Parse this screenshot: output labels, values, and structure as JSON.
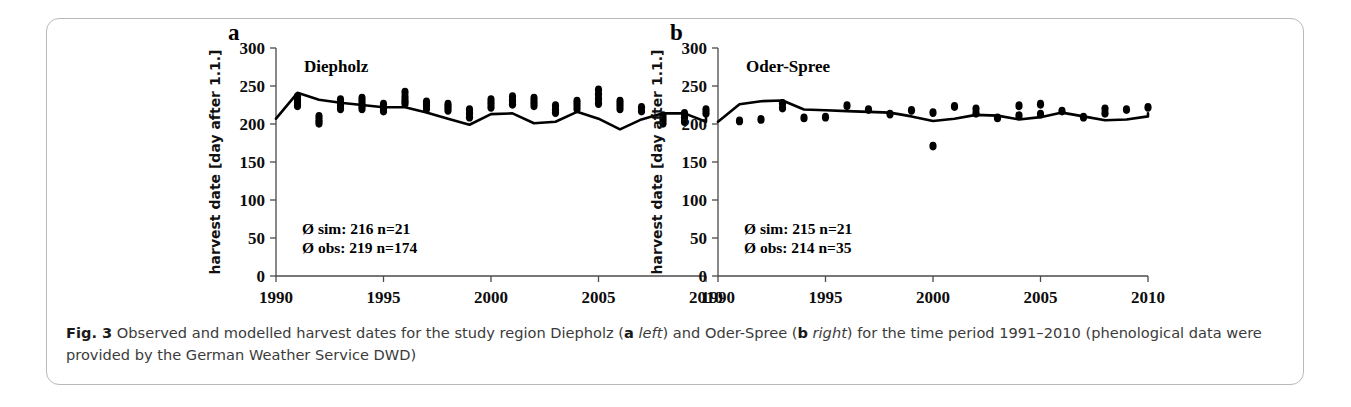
{
  "figure": {
    "id": "Fig. 3",
    "caption_text": "Observed and modelled harvest dates for the study region Diepholz (a left) and Oder-Spree (b right) for the time period 1991–2010 (phenological data were provided by the German Weather Service DWD)",
    "caption_part1": "Observed and modelled harvest dates for the study region Diepholz (",
    "caption_a": "a",
    "caption_a_ital": "left",
    "caption_part2": ") and Oder-Spree (",
    "caption_b": "b",
    "caption_b_ital": "right",
    "caption_part3": ") for the time period 1991–2010 (phenological data were provided by the German Weather Service DWD)",
    "border_color": "#b9b9b9",
    "line_color": "#000000",
    "point_color": "#000000"
  },
  "chart_data": [
    {
      "panel": "a",
      "type": "scatter",
      "title": "Diepholz",
      "xlabel": "",
      "ylabel": "harvest date [day after 1.1.]",
      "xlim": [
        1990,
        2010
      ],
      "ylim": [
        0,
        300
      ],
      "xticks": [
        1990,
        1995,
        2000,
        2005,
        2010
      ],
      "yticks": [
        0,
        50,
        100,
        150,
        200,
        250,
        300
      ],
      "grid": false,
      "legend": "none",
      "annotations": [
        "Ø sim: 216 n=21",
        "Ø obs: 219 n=174"
      ],
      "stats": {
        "sim_mean": 216,
        "sim_n": 21,
        "obs_mean": 219,
        "obs_n": 174
      },
      "series": [
        {
          "name": "simulated",
          "style": "line",
          "x": [
            1990,
            1991,
            1992,
            1993,
            1994,
            1995,
            1996,
            1997,
            1998,
            1999,
            2000,
            2001,
            2002,
            2003,
            2004,
            2005,
            2006,
            2007,
            2008,
            2009,
            2010
          ],
          "values": [
            207,
            241,
            232,
            228,
            225,
            222,
            222,
            215,
            207,
            199,
            213,
            214,
            201,
            203,
            216,
            207,
            193,
            206,
            214,
            214,
            203,
            217
          ]
        },
        {
          "name": "observed",
          "style": "points",
          "x": [
            1991,
            1991,
            1991,
            1991,
            1992,
            1992,
            1992,
            1993,
            1993,
            1993,
            1993,
            1994,
            1994,
            1994,
            1994,
            1995,
            1995,
            1995,
            1996,
            1996,
            1996,
            1996,
            1997,
            1997,
            1997,
            1998,
            1998,
            1998,
            1999,
            1999,
            1999,
            2000,
            2000,
            2000,
            2001,
            2001,
            2001,
            2002,
            2002,
            2002,
            2003,
            2003,
            2003,
            2004,
            2004,
            2004,
            2005,
            2005,
            2005,
            2005,
            2006,
            2006,
            2006,
            2007,
            2007,
            2008,
            2008,
            2008,
            2009,
            2009,
            2009,
            2010,
            2010
          ],
          "values": [
            236,
            232,
            228,
            224,
            210,
            205,
            201,
            232,
            228,
            224,
            220,
            234,
            229,
            224,
            220,
            226,
            221,
            217,
            242,
            236,
            231,
            227,
            229,
            225,
            220,
            226,
            222,
            218,
            219,
            214,
            209,
            232,
            227,
            222,
            236,
            231,
            226,
            234,
            229,
            224,
            224,
            219,
            215,
            230,
            225,
            220,
            245,
            239,
            233,
            227,
            230,
            225,
            220,
            222,
            217,
            211,
            206,
            201,
            214,
            209,
            203,
            219,
            214
          ]
        }
      ]
    },
    {
      "panel": "b",
      "type": "scatter",
      "title": "Oder-Spree",
      "xlabel": "",
      "ylabel": "harvest date [day after 1.1.]",
      "xlim": [
        1990,
        2010
      ],
      "ylim": [
        0,
        300
      ],
      "xticks": [
        1990,
        1995,
        2000,
        2005,
        2010
      ],
      "yticks": [
        0,
        50,
        100,
        150,
        200,
        250,
        300
      ],
      "grid": false,
      "legend": "none",
      "annotations": [
        "Ø sim: 215 n=21",
        "Ø obs: 214 n=35"
      ],
      "stats": {
        "sim_mean": 215,
        "sim_n": 21,
        "obs_mean": 214,
        "obs_n": 35
      },
      "series": [
        {
          "name": "simulated",
          "style": "line",
          "x": [
            1990,
            1991,
            1992,
            1993,
            1994,
            1995,
            1996,
            1997,
            1998,
            1999,
            2000,
            2001,
            2002,
            2003,
            2004,
            2005,
            2006,
            2007,
            2008,
            2009,
            2010
          ],
          "values": [
            203,
            226,
            230,
            231,
            219,
            218,
            217,
            216,
            215,
            210,
            204,
            207,
            212,
            211,
            206,
            209,
            215,
            210,
            205,
            206,
            210,
            214
          ]
        },
        {
          "name": "observed",
          "style": "points",
          "x": [
            1991,
            1992,
            1993,
            1993,
            1994,
            1995,
            1996,
            1997,
            1998,
            1999,
            2000,
            2000,
            2001,
            2002,
            2002,
            2003,
            2004,
            2004,
            2005,
            2005,
            2006,
            2007,
            2008,
            2008,
            2009,
            2010
          ],
          "values": [
            204,
            206,
            227,
            221,
            208,
            209,
            224,
            219,
            213,
            218,
            215,
            171,
            223,
            220,
            214,
            208,
            224,
            211,
            226,
            213,
            217,
            209,
            220,
            214,
            219,
            222
          ]
        }
      ]
    }
  ]
}
